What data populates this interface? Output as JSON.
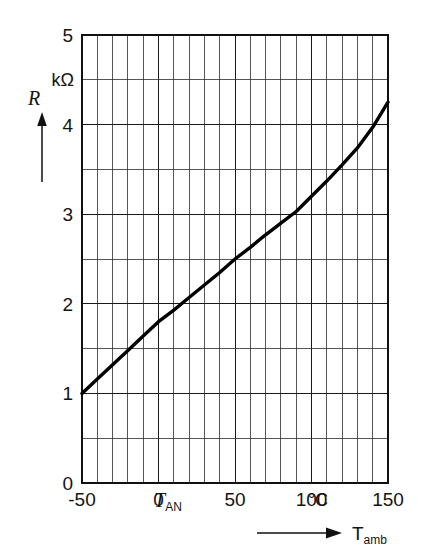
{
  "chart_data": {
    "type": "line",
    "title": "",
    "subtitle": "",
    "xlabel": "T_amb",
    "xlabel_display": "T",
    "xlabel_sub": "amb",
    "ylabel": "R",
    "x_unit": "°C",
    "y_unit": "kΩ",
    "xlim": [
      -50,
      150
    ],
    "ylim": [
      0,
      5
    ],
    "x_major_ticks": [
      -50,
      0,
      50,
      100,
      150
    ],
    "x_tick_labels": [
      "-50",
      "0",
      "50",
      "100",
      "150"
    ],
    "y_major_ticks": [
      0,
      1,
      2,
      3,
      4,
      5
    ],
    "y_tick_labels": [
      "0",
      "1",
      "2",
      "3",
      "4",
      "5"
    ],
    "x_gridline_step": 10,
    "y_gridline_step": 0.5,
    "grid": true,
    "legend": false,
    "annotations": [
      {
        "name": "t-an-marker",
        "text": "T",
        "sub": "AN",
        "x": 25,
        "axis": "x"
      },
      {
        "name": "x-unit-celsius",
        "text": "°C",
        "x": 120,
        "axis": "x"
      },
      {
        "name": "y-unit-kohm",
        "text": "kΩ",
        "y": 4.5,
        "axis": "y"
      }
    ],
    "series": [
      {
        "name": "resistance-vs-temperature",
        "color": "#000000",
        "x": [
          -50,
          -40,
          -30,
          -20,
          -10,
          0,
          10,
          20,
          30,
          40,
          50,
          60,
          70,
          80,
          90,
          100,
          110,
          120,
          130,
          140,
          150
        ],
        "values": [
          1.0,
          1.16,
          1.32,
          1.48,
          1.64,
          1.8,
          1.93,
          2.07,
          2.21,
          2.35,
          2.5,
          2.63,
          2.77,
          2.9,
          3.03,
          3.2,
          3.37,
          3.55,
          3.74,
          3.97,
          4.25
        ]
      }
    ]
  },
  "figure": {
    "y_axis_symbol": "R",
    "y_axis_unit": "kΩ",
    "x_axis_symbol": "T",
    "x_axis_subscript": "amb",
    "x_unit": "°C",
    "t_an_symbol": "T",
    "t_an_subscript": "AN"
  },
  "colors": {
    "curve": "#000000",
    "grid_minor": "#2b2b2b",
    "grid_major": "#1a1a1a",
    "frame": "#111111",
    "text": "#141414",
    "background": "#ffffff"
  }
}
